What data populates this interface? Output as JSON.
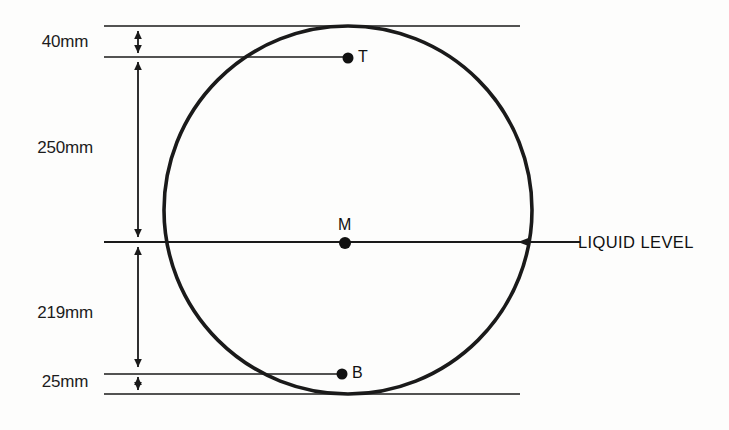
{
  "diagram": {
    "background_color": "#fdfdfc",
    "line_color": "#1a1a1a",
    "circle": {
      "name": "tank-cross-section",
      "center_x": 348,
      "center_y": 210,
      "radius": 184,
      "stroke_width": 3.6
    },
    "dimensions": [
      {
        "id": "top-clearance",
        "label": "40mm",
        "value": 40,
        "unit": "mm",
        "from_y": 26,
        "to_y": 57,
        "label_x": 65,
        "label_y": 42
      },
      {
        "id": "upper-depth",
        "label": "250mm",
        "value": 250,
        "unit": "mm",
        "from_y": 57,
        "to_y": 242,
        "label_x": 65,
        "label_y": 148
      },
      {
        "id": "lower-depth",
        "label": "219mm",
        "value": 219,
        "unit": "mm",
        "from_y": 242,
        "to_y": 372,
        "label_x": 65,
        "label_y": 313
      },
      {
        "id": "bottom-clearance",
        "label": "25mm",
        "value": 25,
        "unit": "mm",
        "from_y": 372,
        "to_y": 394,
        "label_x": 65,
        "label_y": 382
      }
    ],
    "reference_lines": [
      {
        "id": "tank-top-line",
        "y": 26
      },
      {
        "id": "top-point-line",
        "y": 57
      },
      {
        "id": "liquid-level-line",
        "y": 242
      },
      {
        "id": "bottom-point-line",
        "y": 374
      },
      {
        "id": "tank-bottom-line",
        "y": 394
      }
    ],
    "points": [
      {
        "id": "point-t",
        "label": "T",
        "x": 348,
        "y": 58,
        "label_x": 358,
        "label_y": 48,
        "radius": 5.5
      },
      {
        "id": "point-m",
        "label": "M",
        "x": 345,
        "y": 243,
        "label_x": 338,
        "label_y": 216,
        "radius": 6.0
      },
      {
        "id": "point-b",
        "label": "B",
        "x": 342,
        "y": 374,
        "label_x": 352,
        "label_y": 364,
        "radius": 5.5
      }
    ],
    "annotations": [
      {
        "id": "liquid-level-annotation",
        "text": "LIQUID LEVEL",
        "text_x": 578,
        "text_y": 234,
        "arrow_from_x": 574,
        "arrow_to_x": 520,
        "arrow_y": 242
      }
    ]
  }
}
